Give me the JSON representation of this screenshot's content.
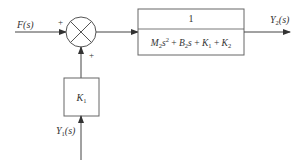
{
  "diagram": {
    "type": "block-diagram",
    "input": {
      "label": "F(s)",
      "sign": "+"
    },
    "summing_junction": {
      "symbol": "X-circle",
      "inputs": [
        "F(s)",
        "K1 feedback"
      ],
      "signs": [
        "+",
        "+"
      ]
    },
    "transfer_block": {
      "numerator": "1",
      "denominator": "M2s^2 + B2s + K1 + K2",
      "den_parts": {
        "m": "M",
        "m_sub": "2",
        "s": "s",
        "s_sup": "2",
        "plus1": " + ",
        "b": "B",
        "b_sub": "2",
        "s2": "s",
        "plus2": " + ",
        "k1": "K",
        "k1_sub": "1",
        "plus3": " + ",
        "k2": "K",
        "k2_sub": "2"
      }
    },
    "output": {
      "label_base": "Y",
      "label_sub": "2",
      "label_tail": "(s)"
    },
    "gain_block": {
      "base": "K",
      "sub": "1"
    },
    "secondary_input": {
      "label_base": "Y",
      "label_sub": "1",
      "label_tail": "(s)",
      "sign": "+"
    },
    "colors": {
      "stroke": "#444444",
      "background": "#ffffff"
    }
  }
}
